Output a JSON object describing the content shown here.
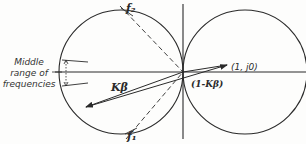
{
  "diagram": {
    "type": "nyquist-circle-locus",
    "labels": {
      "f2": "f₂",
      "f1": "f₁",
      "k_beta": "Kβ",
      "one_minus_k_beta": "(1-Kβ)",
      "point": "(1, j0)",
      "side_line1": "Middle",
      "side_line2": "range of",
      "side_line3": "frequencies"
    },
    "colors": {
      "ink": "#2a2a2a",
      "background": "#fdfdfc"
    },
    "geometry": {
      "origin": [
        183,
        72
      ],
      "left_circle": {
        "cx": 121,
        "cy": 72,
        "r": 62
      },
      "right_circle": {
        "cx": 245,
        "cy": 72,
        "r": 62
      },
      "point_1_j0": [
        228,
        64
      ],
      "k_beta_tip": [
        85,
        107
      ],
      "f2_point": [
        127,
        11
      ],
      "f1_point": [
        131,
        133
      ]
    }
  }
}
